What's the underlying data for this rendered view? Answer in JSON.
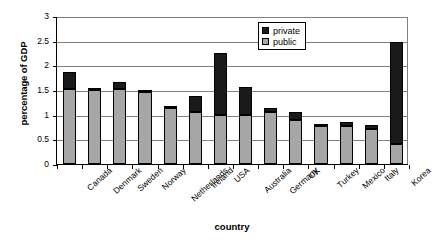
{
  "chart_data": {
    "type": "bar",
    "subtype": "stacked-vertical",
    "title": "",
    "xlabel": "country",
    "ylabel": "percentage of GDP",
    "ylim": [
      0,
      3
    ],
    "yticks": [
      "0",
      "0.5",
      "1",
      "1.5",
      "2",
      "2.5",
      "3"
    ],
    "ytick_values": [
      0,
      0.5,
      1,
      1.5,
      2,
      2.5,
      3
    ],
    "grid": true,
    "legend_position": "top-right-inside",
    "categories": [
      "Canada",
      "Denmark",
      "Sweden",
      "Norway",
      "Netherlands",
      "Ireland",
      "USA",
      "Australia",
      "Germany",
      "UK",
      "Turkey",
      "Mexico",
      "Italy",
      "Korea"
    ],
    "series": [
      {
        "name": "public",
        "color": "#a6a6a6",
        "values": [
          1.53,
          1.5,
          1.52,
          1.46,
          1.13,
          1.05,
          1.0,
          1.0,
          1.05,
          0.9,
          0.78,
          0.77,
          0.71,
          0.4
        ]
      },
      {
        "name": "private",
        "color": "#1a1a1a",
        "values": [
          0.34,
          0.04,
          0.14,
          0.05,
          0.03,
          0.33,
          1.26,
          0.56,
          0.08,
          0.16,
          0.01,
          0.08,
          0.08,
          2.08
        ]
      }
    ],
    "totals": [
      1.87,
      1.54,
      1.66,
      1.51,
      1.16,
      1.38,
      2.26,
      1.56,
      1.13,
      1.06,
      0.79,
      0.85,
      0.79,
      2.48
    ]
  },
  "legend": {
    "items": [
      {
        "label": "private",
        "color": "#1a1a1a"
      },
      {
        "label": "public",
        "color": "#a6a6a6"
      }
    ]
  },
  "axes": {
    "y_title": "percentage of GDP",
    "x_title": "country"
  }
}
